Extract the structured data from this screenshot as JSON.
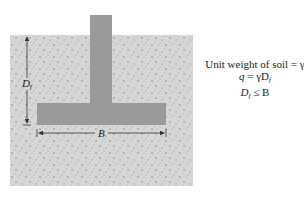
{
  "figure": {
    "labels": {
      "depth": "D",
      "depth_sub": "f",
      "width": "B"
    },
    "equations": {
      "line1": "Unit weight of soil = γ",
      "line2_lhs": "q",
      "line2_mid": " = γD",
      "line2_sub": "f",
      "line3_lhs": "D",
      "line3_sub": "f",
      "line3_rhs": " ≤ B"
    },
    "colors": {
      "soil": "#d6d6d6",
      "footing": "#9a9a9a",
      "speckle": "#8a8a8a",
      "line": "#333333"
    }
  }
}
